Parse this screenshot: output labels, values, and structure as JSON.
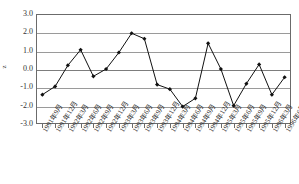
{
  "chart_data": {
    "type": "line",
    "title": "",
    "subtitle": "",
    "xlabel": "",
    "ylabel": "z",
    "ylim": [
      -3.0,
      3.0
    ],
    "yticks": [
      "3.0",
      "2.0",
      "1.0",
      "0.0",
      "-1.0",
      "-2.0",
      "-3.0"
    ],
    "ytick_values": [
      3.0,
      2.0,
      1.0,
      0.0,
      -1.0,
      -2.0,
      -3.0
    ],
    "grid": true,
    "legend": "none",
    "marker": "filled-diamond",
    "line_color": "#111111",
    "grid_color": "#9a9a9a",
    "frame_color": "#6b6b6b",
    "categories": [
      "1991年9月",
      "1991年12月",
      "1992年3月",
      "1992年6月",
      "1992年9月",
      "1992年12月",
      "1993年3月",
      "1993年6月",
      "1993年9月",
      "1993年12月",
      "1994年3月",
      "1994年6月",
      "1994年9月",
      "1994年12月",
      "1995年3月",
      "1995年6月",
      "1995年9月",
      "1995年12月",
      "1996年3月",
      "1996年6月"
    ],
    "values": [
      -1.4,
      -0.95,
      0.2,
      1.05,
      -0.4,
      0.0,
      0.9,
      1.95,
      1.65,
      -0.85,
      -1.1,
      -2.05,
      -1.6,
      1.4,
      0.0,
      -2.0,
      -0.8,
      0.25,
      -1.4,
      -0.45
    ]
  }
}
